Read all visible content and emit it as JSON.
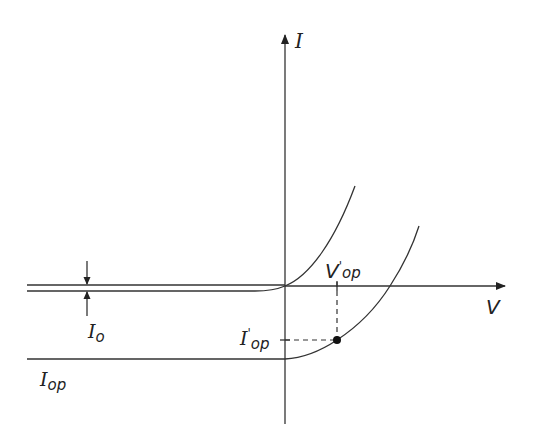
{
  "diagram": {
    "colors": {
      "stroke": "#333333",
      "background": "#ffffff"
    },
    "axes": {
      "y_label": "I",
      "x_label": "V"
    },
    "labels": {
      "dark_current": "I",
      "dark_current_sub": "o",
      "photocurrent": "I",
      "photocurrent_sub": "op",
      "op_current": "I",
      "op_current_prime": "'",
      "op_current_sub": "op",
      "op_voltage": "V",
      "op_voltage_prime": "'",
      "op_voltage_sub": "op"
    },
    "curves": [
      {
        "name": "dark-curve",
        "description": "I-V curve without illumination, saturates at -Io"
      },
      {
        "name": "illuminated-curve",
        "description": "I-V curve under illumination, saturates at -Iop"
      }
    ],
    "operating_point": {
      "label_v": "V'op",
      "label_i": "I'op"
    }
  }
}
